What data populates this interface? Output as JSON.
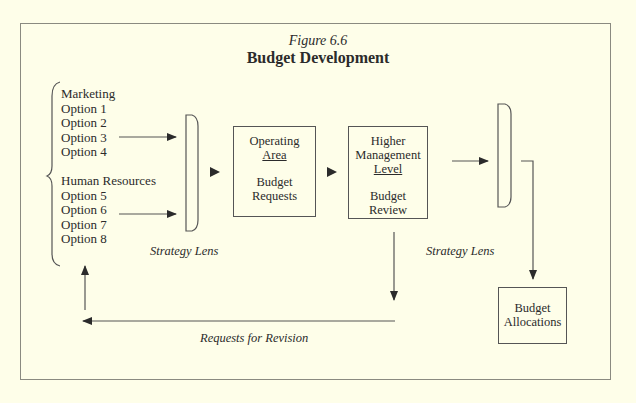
{
  "figure": {
    "number": "Figure 6.6",
    "title": "Budget Development"
  },
  "options": {
    "group1": {
      "heading": "Marketing",
      "items": [
        "Option 1",
        "Option 2",
        "Option 3",
        "Option 4"
      ]
    },
    "group2": {
      "heading": "Human Resources",
      "items": [
        "Option 5",
        "Option 6",
        "Option 7",
        "Option 8"
      ]
    }
  },
  "boxes": {
    "operating": {
      "line1": "Operating",
      "line2": "Area",
      "line3": "Budget",
      "line4": "Requests"
    },
    "higher": {
      "line1": "Higher",
      "line2": "Management",
      "line3": "Level",
      "line4": "Budget",
      "line5": "Review"
    },
    "allocations": {
      "line1": "Budget",
      "line2": "Allocations"
    }
  },
  "labels": {
    "lens1": "Strategy Lens",
    "lens2": "Strategy Lens",
    "revision": "Requests for Revision"
  },
  "colors": {
    "background": "#fefee9",
    "lines": "#555555",
    "text": "#2b2b2b"
  }
}
